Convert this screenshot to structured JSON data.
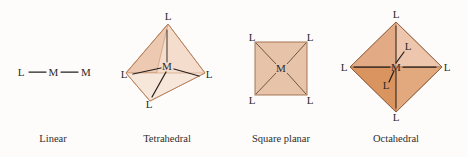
{
  "figure": {
    "background_color": "#fdfcfa"
  },
  "palette": {
    "fill_light": "#f0d3bd",
    "fill_mid": "#e8c0a2",
    "fill_medium": "#e0aa86",
    "fill_dark": "#d2906a",
    "fill_square": "#e7c3a9",
    "edge_light": "#b07a54",
    "edge_dark": "#8d5c3c",
    "bond_color": "#25201d",
    "text_color": "#2b2b2b"
  },
  "geometries": [
    {
      "id": "linear",
      "caption": "Linear",
      "metal": "M",
      "ligand": "L",
      "ligand_count": 2,
      "labels": [
        "L",
        "M",
        "L"
      ]
    },
    {
      "id": "tetrahedral",
      "caption": "Tetrahedral",
      "metal": "M",
      "ligand": "L",
      "ligand_count": 4,
      "labels": [
        "L",
        "L",
        "L",
        "L"
      ]
    },
    {
      "id": "square-planar",
      "caption": "Square planar",
      "metal": "M",
      "ligand": "L",
      "ligand_count": 4,
      "labels": [
        "L",
        "L",
        "L",
        "L"
      ]
    },
    {
      "id": "octahedral",
      "caption": "Octahedral",
      "metal": "M",
      "ligand": "L",
      "ligand_count": 6,
      "labels": [
        "L",
        "L",
        "L",
        "L",
        "L",
        "L"
      ]
    }
  ]
}
